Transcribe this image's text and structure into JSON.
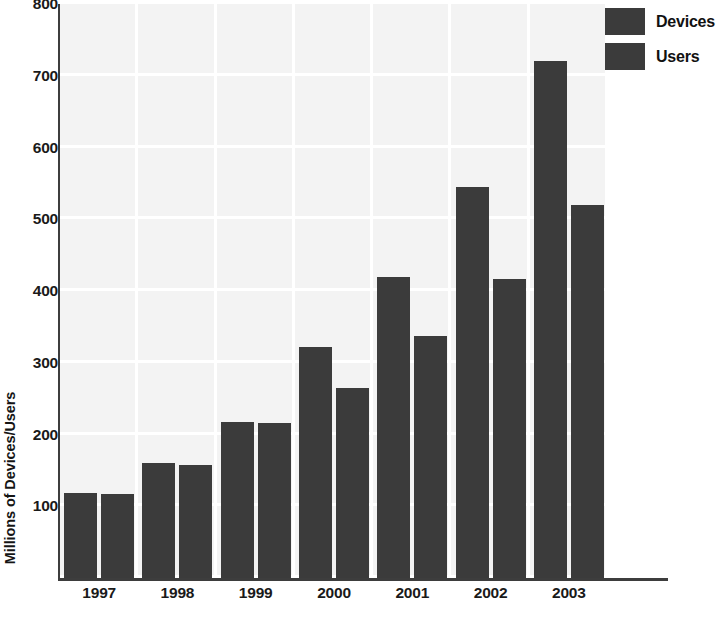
{
  "chart_data": {
    "type": "bar",
    "title": "",
    "subtitle": "",
    "xlabel": "",
    "ylabel": "Millions of Devices/Users",
    "categories": [
      "1997",
      "1998",
      "1999",
      "2000",
      "2001",
      "2002",
      "2003"
    ],
    "series": [
      {
        "name": "Devices",
        "values": [
          118,
          160,
          218,
          322,
          420,
          545,
          720
        ],
        "color": "#3b3b3b"
      },
      {
        "name": "Users",
        "values": [
          117,
          158,
          216,
          265,
          337,
          417,
          520
        ],
        "color": "#3b3b3b"
      }
    ],
    "ylim": [
      0,
      800
    ],
    "yticks": [
      100,
      200,
      300,
      400,
      500,
      600,
      700,
      800
    ],
    "ytick_labels": [
      "100",
      "200",
      "300",
      "400",
      "500",
      "600",
      "700",
      "800"
    ],
    "grid": true,
    "grid_style": "light-blocks",
    "legend_position": "top-right",
    "legend_entries": [
      "Devices",
      "Users"
    ],
    "bar_color": "#3b3b3b",
    "plot_background": "#f3f3f3",
    "axis_color": "#3d3d3d",
    "page_background": "#ffffff"
  }
}
